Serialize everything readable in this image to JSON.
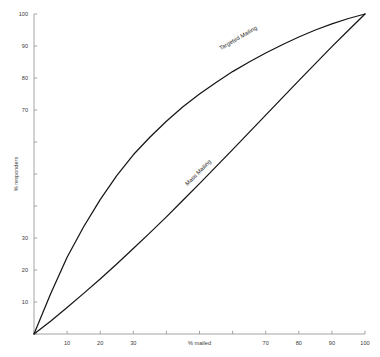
{
  "chart_data": {
    "type": "line",
    "title": "",
    "xlabel": "% mailed",
    "ylabel": "% responders",
    "xlim": [
      0,
      100
    ],
    "ylim": [
      0,
      100
    ],
    "grid": false,
    "legend_position": "inline-curve-labels",
    "x_ticks": [
      0,
      10,
      20,
      30,
      40,
      50,
      60,
      70,
      80,
      90,
      100
    ],
    "x_tick_labels": [
      "",
      "10",
      "20",
      "30",
      "",
      "",
      "",
      "70",
      "80",
      "90",
      "100"
    ],
    "y_ticks": [
      0,
      10,
      20,
      30,
      40,
      50,
      60,
      70,
      80,
      90,
      100
    ],
    "y_tick_labels": [
      "",
      "10",
      "20",
      "30",
      "",
      "",
      "",
      "70",
      "80",
      "90",
      "100"
    ],
    "x": [
      0,
      5,
      10,
      15,
      20,
      25,
      30,
      35,
      40,
      45,
      50,
      55,
      60,
      65,
      70,
      75,
      80,
      85,
      90,
      95,
      100
    ],
    "series": [
      {
        "name": "Targeted Mailing",
        "color": "#161616",
        "label_x": 62,
        "label_y": 92,
        "values": [
          0,
          12.5,
          24.0,
          33.5,
          42.0,
          49.5,
          56.0,
          61.5,
          66.5,
          71.0,
          75.0,
          78.6,
          82.0,
          85.0,
          87.8,
          90.4,
          92.8,
          95.0,
          96.9,
          98.6,
          100
        ]
      },
      {
        "name": "Mass Mailing",
        "color": "#161616",
        "label_x": 50,
        "label_y": 50,
        "values": [
          0,
          4.0,
          8.3,
          12.7,
          17.2,
          21.9,
          26.7,
          31.6,
          36.6,
          41.8,
          47.0,
          52.3,
          57.6,
          63.0,
          68.4,
          73.8,
          79.2,
          84.5,
          89.8,
          94.9,
          100
        ]
      }
    ]
  }
}
